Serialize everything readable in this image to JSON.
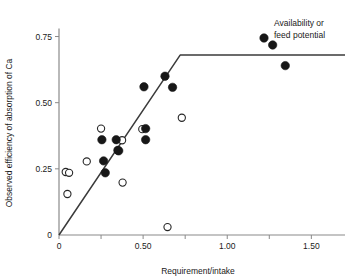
{
  "chart_data": {
    "type": "scatter",
    "title": "",
    "xlabel": "Requirement/intake",
    "ylabel": "Observed efficiency of absorption of Ca",
    "xlim": [
      0,
      1.7
    ],
    "ylim": [
      0,
      0.82
    ],
    "grid": false,
    "legend_position": "top-right",
    "legend": [
      {
        "label_line1": "Availability or",
        "label_line2": "feed potential",
        "marker": "filled-circle"
      }
    ],
    "xticks": [
      {
        "value": 0,
        "label": "0"
      },
      {
        "value": 0.25,
        "label": ""
      },
      {
        "value": 0.5,
        "label": "0.50"
      },
      {
        "value": 0.75,
        "label": ""
      },
      {
        "value": 1.0,
        "label": "1.00"
      },
      {
        "value": 1.25,
        "label": ""
      },
      {
        "value": 1.5,
        "label": "1.50"
      }
    ],
    "yticks": [
      {
        "value": 0,
        "label": "0"
      },
      {
        "value": 0.25,
        "label": "0.25"
      },
      {
        "value": 0.5,
        "label": "0.50"
      },
      {
        "value": 0.75,
        "label": "0.75"
      }
    ],
    "annotations": [
      {
        "name": "broken-stick-fit",
        "type": "polyline",
        "points": [
          [
            0.0,
            0.0
          ],
          [
            0.72,
            0.68
          ],
          [
            1.7,
            0.68
          ]
        ]
      }
    ],
    "series": [
      {
        "name": "Availability or feed potential",
        "marker": "filled-circle",
        "points": [
          [
            0.255,
            0.36
          ],
          [
            0.265,
            0.28
          ],
          [
            0.275,
            0.235
          ],
          [
            0.34,
            0.36
          ],
          [
            0.35,
            0.32
          ],
          [
            0.355,
            0.318
          ],
          [
            0.505,
            0.56
          ],
          [
            0.515,
            0.402
          ],
          [
            0.515,
            0.36
          ],
          [
            0.63,
            0.6
          ],
          [
            0.675,
            0.558
          ],
          [
            1.27,
            0.718
          ],
          [
            1.345,
            0.64
          ]
        ]
      },
      {
        "name": "Observed open markers",
        "marker": "open-circle",
        "points": [
          [
            0.04,
            0.238
          ],
          [
            0.06,
            0.235
          ],
          [
            0.05,
            0.155
          ],
          [
            0.165,
            0.278
          ],
          [
            0.25,
            0.402
          ],
          [
            0.375,
            0.358
          ],
          [
            0.378,
            0.198
          ],
          [
            0.495,
            0.4
          ],
          [
            0.645,
            0.03
          ],
          [
            0.73,
            0.443
          ]
        ]
      }
    ]
  }
}
